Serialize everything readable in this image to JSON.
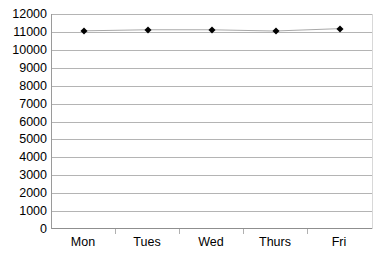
{
  "chart_data": {
    "type": "line",
    "title": "",
    "subtitle": "",
    "xlabel": "",
    "ylabel": "",
    "categories": [
      "Mon",
      "Tues",
      "Wed",
      "Thurs",
      "Fri"
    ],
    "values": [
      11060,
      11120,
      11120,
      11050,
      11180
    ],
    "series": [
      {
        "name": "Series1",
        "values": [
          11060,
          11120,
          11120,
          11050,
          11180
        ]
      }
    ],
    "ylim": [
      0,
      12000
    ],
    "ytick_step": 1000,
    "yticks": [
      0,
      1000,
      2000,
      3000,
      4000,
      5000,
      6000,
      7000,
      8000,
      9000,
      10000,
      11000,
      12000
    ],
    "ytick_labels": [
      "0",
      "1000",
      "2000",
      "3000",
      "4000",
      "5000",
      "6000",
      "7000",
      "8000",
      "9000",
      "10000",
      "11000",
      "12000"
    ],
    "grid": true,
    "grid_axis": "y",
    "legend": false,
    "legend_position": "none",
    "marker": "diamond",
    "marker_color": "#000000",
    "line_color": "#a8a8a8",
    "gridline_color": "#b4b4b4",
    "axis_color": "#8f8f8f",
    "background_color": "#ffffff",
    "text_color": "#000000",
    "annotations": []
  }
}
